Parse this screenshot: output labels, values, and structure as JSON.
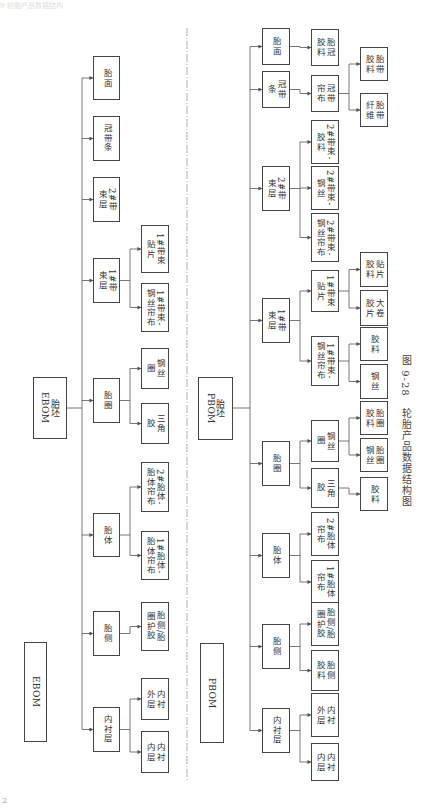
{
  "header": {
    "text": "9  轮胎产品数据结构"
  },
  "page_number": "2",
  "caption": {
    "figure_no": "图 9-28",
    "title": "轮胎产品数据结构图"
  },
  "ebom": {
    "title": "EBOM",
    "root": "胎坯\nEBOM",
    "level1": [
      {
        "id": "tread",
        "label": "胎面",
        "x": 93,
        "y": 56,
        "h": 44
      },
      {
        "id": "cap_strip",
        "label": "冠带条",
        "x": 93,
        "y": 116,
        "h": 45
      },
      {
        "id": "belt2",
        "label": "2#带\n束层",
        "x": 93,
        "y": 177,
        "h": 45
      },
      {
        "id": "belt1",
        "label": "1#带\n束层",
        "x": 93,
        "y": 258,
        "h": 45
      },
      {
        "id": "bead",
        "label": "胎圈",
        "x": 93,
        "y": 378,
        "h": 45
      },
      {
        "id": "carcass",
        "label": "胎体",
        "x": 93,
        "y": 513,
        "h": 44
      },
      {
        "id": "sidewall",
        "label": "胎侧",
        "x": 93,
        "y": 611,
        "h": 45
      },
      {
        "id": "innerliner",
        "label": "内衬层",
        "x": 93,
        "y": 707,
        "h": 45
      }
    ],
    "level2": [
      {
        "parent": "belt1",
        "label": "1#带束\n贴片",
        "y": 225,
        "h": 48
      },
      {
        "parent": "belt1",
        "label": "1#带束-\n钢丝帘布",
        "y": 283,
        "h": 49
      },
      {
        "parent": "bead",
        "label": "钢丝\n圈",
        "y": 348,
        "h": 41
      },
      {
        "parent": "bead",
        "label": "三角\n胶",
        "y": 403,
        "h": 41
      },
      {
        "parent": "carcass",
        "label": "2#胎体-\n胎体帘布",
        "y": 462,
        "h": 50
      },
      {
        "parent": "carcass",
        "label": "1#胎体-\n胎体帘布",
        "y": 531,
        "h": 49
      },
      {
        "parent": "sidewall",
        "label": "胎侧/胎\n圈护胶",
        "y": 602,
        "h": 49
      },
      {
        "parent": "innerliner",
        "label": "内衬\n外层",
        "y": 678,
        "h": 42
      },
      {
        "parent": "innerliner",
        "label": "内衬\n内层",
        "y": 731,
        "h": 42
      }
    ]
  },
  "pbom": {
    "title": "PBOM",
    "root": "胎坯\nPBOM",
    "level1": [
      {
        "id": "tread",
        "label": "胎面",
        "y": 28,
        "h": 37
      },
      {
        "id": "cap_strip",
        "label": "冠带\n条",
        "y": 71,
        "h": 37
      },
      {
        "id": "belt2",
        "label": "2#带\n束层",
        "y": 166,
        "h": 45
      },
      {
        "id": "belt1",
        "label": "1#带\n束层",
        "y": 298,
        "h": 45
      },
      {
        "id": "bead",
        "label": "胎圈",
        "y": 441,
        "h": 45
      },
      {
        "id": "carcass",
        "label": "胎体",
        "y": 533,
        "h": 45
      },
      {
        "id": "sidewall",
        "label": "胎侧",
        "y": 624,
        "h": 45
      },
      {
        "id": "innerliner",
        "label": "内衬层",
        "y": 708,
        "h": 45
      }
    ],
    "level2": [
      {
        "id": "tread_comp",
        "parent": "tread",
        "label": "胎冠\n胶料",
        "y": 29,
        "h": 37
      },
      {
        "id": "cap_ply",
        "parent": "cap_strip",
        "label": "冠带\n帘布",
        "y": 75,
        "h": 37
      },
      {
        "id": "b2_rubber",
        "parent": "belt2",
        "label": "2#带束-\n胶料",
        "y": 120,
        "h": 44
      },
      {
        "id": "b2_wire",
        "parent": "belt2",
        "label": "2#带束-\n钢丝",
        "y": 166,
        "h": 44
      },
      {
        "id": "b2_ply",
        "parent": "belt2",
        "label": "2#带束-\n钢丝帘布",
        "y": 213,
        "h": 49
      },
      {
        "id": "b1_patch",
        "parent": "belt1",
        "label": "1#带束\n贴片",
        "y": 270,
        "h": 42
      },
      {
        "id": "b1_ply",
        "parent": "belt1",
        "label": "1#带束-\n钢丝帘布",
        "y": 336,
        "h": 50
      },
      {
        "id": "bead_wire",
        "parent": "bead",
        "label": "钢丝\n圈",
        "y": 420,
        "h": 42
      },
      {
        "id": "apex",
        "parent": "bead",
        "label": "三角\n胶",
        "y": 468,
        "h": 40
      },
      {
        "id": "c2_ply",
        "parent": "carcass",
        "label": "2#胎体\n帘布",
        "y": 512,
        "h": 44
      },
      {
        "id": "c1_ply",
        "parent": "carcass",
        "label": "1#胎体\n帘布",
        "y": 560,
        "h": 44
      },
      {
        "id": "sw_chafer",
        "parent": "sidewall",
        "label": "胎侧/胎\n圈护胶",
        "y": 602,
        "h": 44
      },
      {
        "id": "sw_comp",
        "parent": "sidewall",
        "label": "胎侧\n胶料",
        "y": 650,
        "h": 41
      },
      {
        "id": "il_outer",
        "parent": "innerliner",
        "label": "内衬\n外层",
        "y": 693,
        "h": 44
      },
      {
        "id": "il_inner",
        "parent": "innerliner",
        "label": "内衬\n内层",
        "y": 743,
        "h": 38
      }
    ],
    "level3": [
      {
        "parent": "cap_ply",
        "label": "胎带\n胶料",
        "y": 47,
        "h": 34
      },
      {
        "parent": "cap_ply",
        "label": "胎带\n纤维",
        "y": 93,
        "h": 34
      },
      {
        "parent": "b1_patch",
        "label": "贴片\n胶料",
        "y": 252,
        "h": 35
      },
      {
        "parent": "b1_patch",
        "label": "大卷\n胶片",
        "y": 290,
        "h": 36
      },
      {
        "parent": "b1_ply",
        "label": "胶料",
        "y": 327,
        "h": 34
      },
      {
        "parent": "b1_ply",
        "label": "钢丝",
        "y": 364,
        "h": 35
      },
      {
        "parent": "bead_wire",
        "label": "胎圈\n胶料",
        "y": 401,
        "h": 34
      },
      {
        "parent": "bead_wire",
        "label": "胎圈\n钢丝",
        "y": 438,
        "h": 34
      },
      {
        "parent": "apex",
        "label": "胶料",
        "y": 477,
        "h": 34
      }
    ]
  },
  "colors": {
    "line": "#555555",
    "border": "#444444",
    "text": "#333333",
    "divider": "#999999"
  }
}
